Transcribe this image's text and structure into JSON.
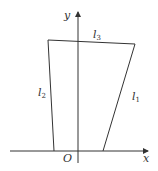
{
  "figure": {
    "axes": {
      "x_label": "x",
      "y_label": "y",
      "origin_label": "O"
    },
    "lines": [
      {
        "name": "l",
        "sub": "1"
      },
      {
        "name": "l",
        "sub": "2"
      },
      {
        "name": "l",
        "sub": "3"
      }
    ],
    "colors": {
      "stroke": "#333333",
      "background": "#ffffff"
    }
  }
}
